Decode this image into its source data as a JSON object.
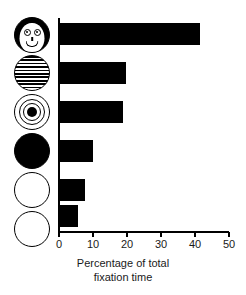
{
  "chart_data": {
    "type": "bar",
    "orientation": "horizontal",
    "title": "",
    "xlabel": "Percentage of total fixation time",
    "xlabel_lines": [
      "Percentage of total",
      "fixation time"
    ],
    "ylabel": "",
    "xlim": [
      0,
      50
    ],
    "xticks": [
      0,
      10,
      20,
      30,
      40,
      50
    ],
    "xtick_labels": [
      "0",
      "10",
      "20",
      "30",
      "40",
      "50"
    ],
    "grid": false,
    "legend": "none",
    "bar_color": "#000000",
    "categories": [
      "face",
      "newsprint",
      "bullseye",
      "solid black disc",
      "white disc",
      "plain disc"
    ],
    "values": [
      41.5,
      19.8,
      18.8,
      10.0,
      7.5,
      5.5
    ],
    "bars": [
      {
        "stimulus": "face",
        "icon": "face-icon",
        "value": 41.5
      },
      {
        "stimulus": "newsprint",
        "icon": "stripes-icon",
        "value": 19.8
      },
      {
        "stimulus": "bullseye",
        "icon": "bullseye-icon",
        "value": 18.8
      },
      {
        "stimulus": "solid black disc",
        "icon": "black-disc-icon",
        "value": 10.0
      },
      {
        "stimulus": "white disc",
        "icon": "white-disc-icon",
        "value": 7.5
      },
      {
        "stimulus": "plain disc",
        "icon": "plain-disc-icon",
        "value": 5.5
      }
    ]
  }
}
